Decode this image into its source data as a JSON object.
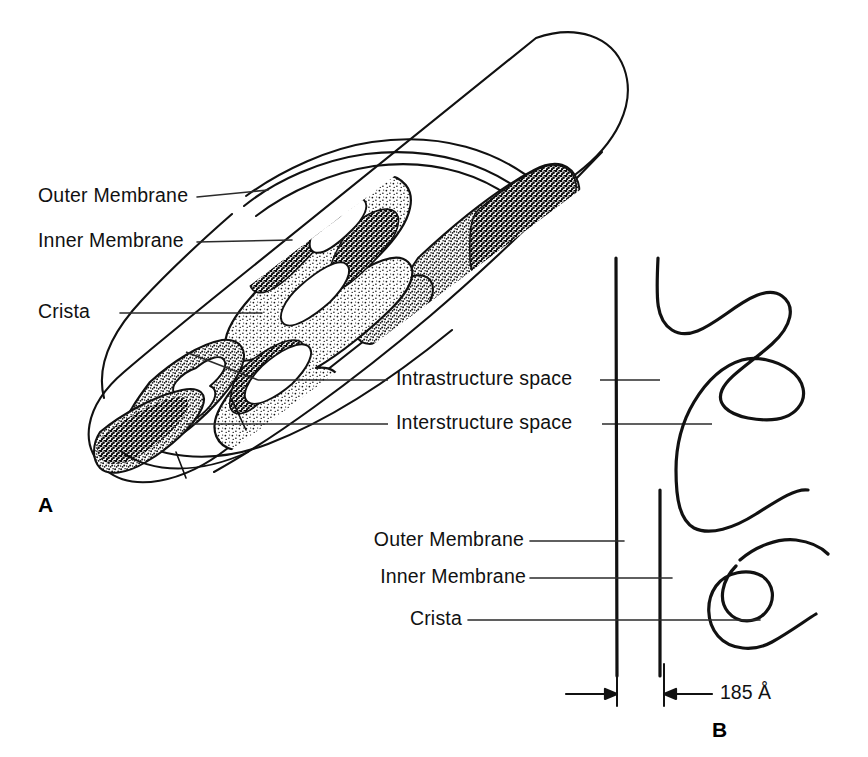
{
  "figure": {
    "background_color": "#ffffff",
    "ink_color": "#111111",
    "leader_color": "#2b2b2b"
  },
  "panel_a": {
    "letter": "A",
    "labels": [
      {
        "id": "outer-membrane",
        "text": "Outer Membrane"
      },
      {
        "id": "inner-membrane",
        "text": "Inner Membrane"
      },
      {
        "id": "crista",
        "text": "Crista"
      }
    ]
  },
  "shared_labels": [
    {
      "id": "intrastructure-space",
      "text": "Intrastructure space"
    },
    {
      "id": "interstructure-space",
      "text": "Interstructure space"
    }
  ],
  "panel_b": {
    "letter": "B",
    "labels": [
      {
        "id": "outer-membrane",
        "text": "Outer Membrane"
      },
      {
        "id": "inner-membrane",
        "text": "Inner Membrane"
      },
      {
        "id": "crista",
        "text": "Crista"
      }
    ],
    "dimension": {
      "value": "185",
      "unit": "Å",
      "text": "185 Å"
    }
  }
}
